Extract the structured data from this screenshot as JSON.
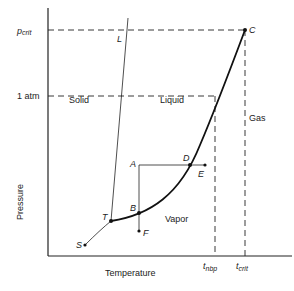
{
  "diagram": {
    "type": "phase-diagram",
    "axes": {
      "xlabel": "Temperature",
      "ylabel": "Pressure",
      "y_ticks": [
        "p_crit",
        "1 atm"
      ],
      "x_ticks": [
        "t_nbp",
        "t_crit"
      ]
    },
    "regions": {
      "solid": "Solid",
      "liquid": "Liquid",
      "vapor": "Vapor",
      "gas": "Gas"
    },
    "points": {
      "S": "S",
      "T": "T",
      "L": "L",
      "C": "C",
      "A": "A",
      "B": "B",
      "D": "D",
      "E": "E",
      "F": "F"
    },
    "tick_labels": {
      "p_crit_main": "p",
      "p_crit_sub": "crit",
      "one_atm": "1 atm",
      "t_nbp_main": "t",
      "t_nbp_sub": "nbp",
      "t_crit_main": "t",
      "t_crit_sub": "crit"
    }
  }
}
